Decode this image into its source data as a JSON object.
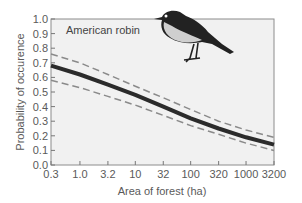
{
  "chart_data": {
    "type": "line",
    "title": "",
    "annotation": "American robin",
    "xlabel": "Area of forest (ha)",
    "ylabel": "Probability of occurence",
    "x_scale": "log",
    "x_ticks": [
      "0.3",
      "1.0",
      "3.2",
      "10",
      "32",
      "100",
      "320",
      "1000",
      "3200"
    ],
    "y_ticks": [
      "0.0",
      "0.1",
      "0.2",
      "0.3",
      "0.4",
      "0.5",
      "0.6",
      "0.7",
      "0.8",
      "0.9",
      "1.0"
    ],
    "ylim": [
      0,
      1.0
    ],
    "xlim": [
      0.3,
      3200
    ],
    "grid": false,
    "legend": null,
    "x": [
      0.3,
      1.0,
      3.2,
      10,
      32,
      100,
      320,
      1000,
      3200
    ],
    "series": [
      {
        "name": "fitted probability",
        "style": "solid",
        "values": [
          0.68,
          0.62,
          0.55,
          0.48,
          0.4,
          0.32,
          0.25,
          0.19,
          0.14
        ]
      },
      {
        "name": "upper confidence limit",
        "style": "dashed",
        "values": [
          0.76,
          0.7,
          0.62,
          0.54,
          0.46,
          0.38,
          0.3,
          0.24,
          0.19
        ]
      },
      {
        "name": "lower confidence limit",
        "style": "dashed",
        "values": [
          0.58,
          0.53,
          0.47,
          0.41,
          0.34,
          0.27,
          0.21,
          0.15,
          0.1
        ]
      }
    ],
    "colors": {
      "solid": "#2b2b2b",
      "dashed": "#8a8a8a",
      "plot_bg": "#f1f1f1",
      "axis": "#777777"
    },
    "illustration": "bird-silhouette"
  }
}
